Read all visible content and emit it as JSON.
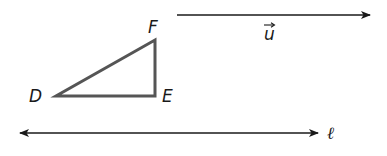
{
  "diagram": {
    "triangle": {
      "vertices": {
        "D": {
          "label": "D",
          "x": 56,
          "y": 96
        },
        "E": {
          "label": "E",
          "x": 155,
          "y": 96
        },
        "F": {
          "label": "F",
          "x": 155,
          "y": 40
        }
      },
      "stroke_color": "#555555"
    },
    "vector": {
      "label": "u",
      "arrow_mark": "→",
      "start": {
        "x": 177,
        "y": 15
      },
      "end": {
        "x": 370,
        "y": 15
      }
    },
    "line": {
      "label": "ℓ",
      "start": {
        "x": 20,
        "y": 133
      },
      "end": {
        "x": 318,
        "y": 133
      }
    },
    "ink_color": "#1a1a1a"
  }
}
